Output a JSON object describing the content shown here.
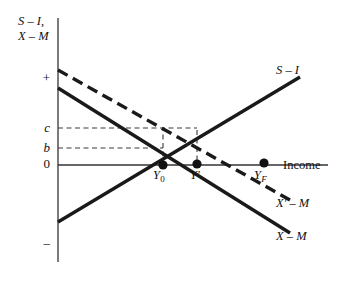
{
  "figure": {
    "axis": {
      "y_label_line1": "S – I,",
      "y_label_line2": "X – M",
      "x_label": "Income",
      "y_ticks": [
        {
          "name": "plus",
          "text": "+",
          "value": "+",
          "y": 78
        },
        {
          "name": "c",
          "text": "c",
          "value": "c",
          "y": 128
        },
        {
          "name": "b",
          "text": "b",
          "value": "b",
          "y": 148
        },
        {
          "name": "zero",
          "text": "0",
          "value": "0",
          "y": 165
        },
        {
          "name": "minus",
          "text": "–",
          "value": "-",
          "y": 243
        }
      ]
    },
    "curves": [
      {
        "name": "s-minus-i",
        "label": "S – I",
        "style": "solid",
        "x1": 58,
        "y1": 222,
        "x2": 300,
        "y2": 77
      },
      {
        "name": "x-minus-m",
        "label": "X – M",
        "style": "solid",
        "x1": 58,
        "y1": 88,
        "x2": 290,
        "y2": 233
      },
      {
        "name": "x-prime-minus-m",
        "label": "X′ – M",
        "style": "dashed",
        "x1": 58,
        "y1": 70,
        "x2": 290,
        "y2": 200
      }
    ],
    "points": [
      {
        "name": "y0",
        "label": "Y",
        "sub": "0",
        "sub_italic": false,
        "x": 163,
        "y": 165
      },
      {
        "name": "y-prime",
        "label": "Y′",
        "sub": "",
        "sub_italic": false,
        "x": 197,
        "y": 164
      },
      {
        "name": "yf",
        "label": "Y",
        "sub": "F",
        "sub_italic": true,
        "x": 264,
        "y": 163
      }
    ],
    "guides": [
      {
        "name": "guide-c-horizontal",
        "x1": 58,
        "y1": 128,
        "x2": 197,
        "y2": 128
      },
      {
        "name": "guide-b-horizontal",
        "x1": 58,
        "y1": 148,
        "x2": 163,
        "y2": 148
      },
      {
        "name": "guide-y0-vertical",
        "x1": 163,
        "y1": 165,
        "x2": 163,
        "y2": 128
      },
      {
        "name": "guide-yprime-vertical",
        "x1": 197,
        "y1": 130,
        "x2": 197,
        "y2": 164
      }
    ],
    "colors": {
      "ink": "#111111",
      "curve": "#1a1a1a",
      "guide": "#3a3a3a",
      "background": "#ffffff"
    }
  }
}
